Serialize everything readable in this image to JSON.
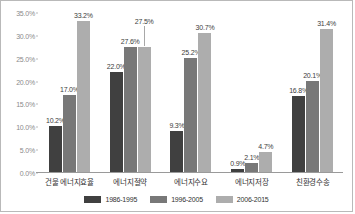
{
  "chart_data": {
    "type": "bar",
    "title": "",
    "xlabel": "",
    "ylabel": "",
    "ylim": [
      0,
      35
    ],
    "grid": false,
    "legend_position": "bottom",
    "categories": [
      "건물 에너지효율",
      "에너지절약",
      "에너지수요",
      "에너지저장",
      "친환경수송"
    ],
    "ytick_labels": [
      "35.0%",
      "30.0%",
      "25.0%",
      "20.0%",
      "15.0%",
      "10.0%",
      "5.0%",
      "0.0%"
    ],
    "ytick_values": [
      35,
      30,
      25,
      20,
      15,
      10,
      5,
      0
    ],
    "series": [
      {
        "name": "1986-1995",
        "color": "#404040",
        "values": [
          10.2,
          22.0,
          9.3,
          0.9,
          16.8
        ],
        "labels": [
          "10.2%",
          "22.0%",
          "9.3%",
          "0.9%",
          "16.8%"
        ]
      },
      {
        "name": "1996-2005",
        "color": "#787878",
        "values": [
          17.0,
          27.6,
          25.2,
          2.1,
          20.1
        ],
        "labels": [
          "17.0%",
          "27.6%",
          "25.2%",
          "2.1%",
          "20.1%"
        ]
      },
      {
        "name": "2006-2015",
        "color": "#adadad",
        "values": [
          33.2,
          27.5,
          30.7,
          4.7,
          31.4
        ],
        "labels": [
          "33.2%",
          "27.5%",
          "30.7%",
          "4.7%",
          "31.4%"
        ]
      }
    ]
  }
}
